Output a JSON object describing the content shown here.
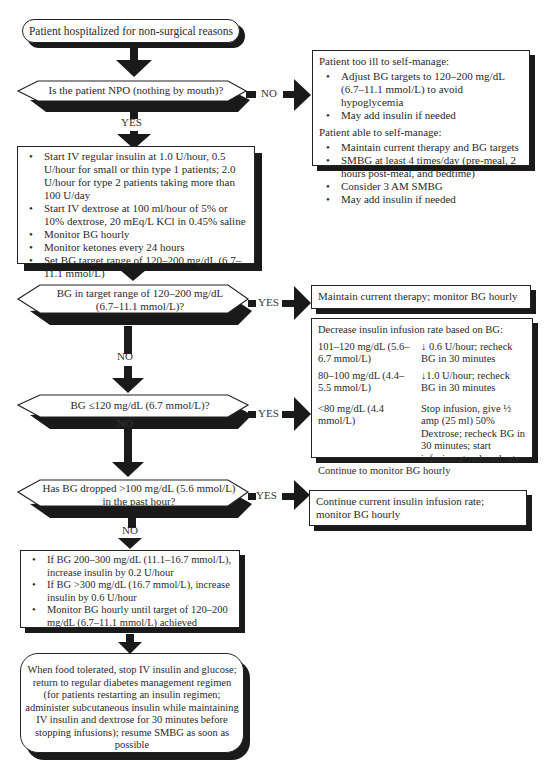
{
  "start": {
    "text": "Patient hospitalized for non-surgical reasons"
  },
  "decision_npo": {
    "question": "Is the patient NPO (nothing by mouth)?",
    "yes_label": "YES",
    "no_label": "NO"
  },
  "npo_no_box": {
    "too_ill_header": "Patient too ill to self-manage:",
    "too_ill_items": [
      "Adjust BG targets to 120–200 mg/dL (6.7–11.1 mmol/L) to avoid hypoglycemia",
      "May add insulin if needed"
    ],
    "able_header": "Patient able to self-manage:",
    "able_items": [
      "Maintain current therapy and BG targets",
      "SMBG at least 4 times/day (pre-meal, 2 hours post-meal, and bedtime)",
      "Consider 3 AM SMBG",
      "May add insulin if needed"
    ]
  },
  "npo_yes_box": {
    "items": [
      "Start IV regular insulin at 1.0 U/hour, 0.5 U/hour for small or thin type 1 patients; 2.0 U/hour for type 2 patients taking more than 100 U/day",
      "Start IV dextrose at 100 ml/hour of 5% or 10% dextrose, 20 mEq/L KCl in 0.45% saline",
      "Monitor BG hourly",
      "Monitor ketones every 24 hours",
      "Set BG target range of 120–200 mg/dL (6.7–11.1 mmol/L)"
    ]
  },
  "decision_target": {
    "question_line1": "BG in target range of 120–200 mg/dL",
    "question_line2": "(6.7–11.1 mmol/L)?",
    "yes_label": "YES",
    "no_label": "NO"
  },
  "target_yes_box": {
    "text": "Maintain current therapy; monitor BG hourly"
  },
  "decision_low": {
    "question": "BG ≤120 mg/dL (6.7 mmol/L)?",
    "yes_label": "YES",
    "no_label": "NO"
  },
  "low_yes_box": {
    "header": "Decrease insulin infusion rate based on BG:",
    "rows": [
      {
        "range": "101–120 mg/dL (5.6–6.7 mmol/L)",
        "action": "↓ 0.6 U/hour; recheck BG in 30 minutes"
      },
      {
        "range": "80–100 mg/dL (4.4–5.5 mmol/L)",
        "action": "↓1.0 U/hour; recheck BG in 30 minutes"
      },
      {
        "range": "<80 mg/dL (4.4 mmol/L)",
        "action": "Stop infusion, give ½ amp (25 ml) 50% Dextrose; recheck BG in 30 minutes; start infusion at reduced rate"
      }
    ],
    "footer": "Continue to monitor BG hourly"
  },
  "decision_drop": {
    "question_line1": "Has BG dropped >100 mg/dL (5.6 mmol/L)",
    "question_line2": "in the past hour?",
    "yes_label": "YES",
    "no_label": "NO"
  },
  "drop_yes_box": {
    "text": "Continue current insulin infusion rate; monitor BG hourly"
  },
  "drop_no_box": {
    "items": [
      "If BG 200–300 mg/dL (11.1–16.7 mmol/L), increase insulin by 0.2 U/hour",
      "If BG >300 mg/dL (16.7 mmol/L), increase insulin by 0.6 U/hour",
      "Monitor BG hourly until target of 120–200 mg/dL (6.7–11.1 mmol/L) achieved"
    ]
  },
  "end": {
    "text": "When food tolerated, stop IV insulin and glucose; return to regular diabetes management regimen (for patients restarting an insulin regimen; administer subcutaneous insulin while maintaining IV insulin and dextrose for 30 minutes before stopping infusions); resume SMBG as soon as possible"
  }
}
